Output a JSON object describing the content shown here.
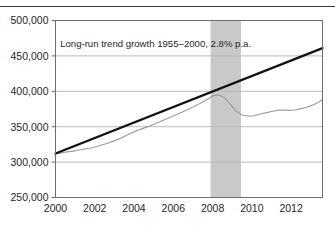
{
  "chart_data": {
    "type": "line",
    "title": "",
    "xlabel": "",
    "ylabel": "",
    "xlim": [
      2000,
      2013.6
    ],
    "ylim": [
      250000,
      500000
    ],
    "grid": true,
    "gridlines_y": [
      300000,
      350000,
      400000,
      450000
    ],
    "legend_position": "none",
    "xticks": [
      2000,
      2002,
      2004,
      2006,
      2008,
      2010,
      2012
    ],
    "xtick_labels": [
      "2000",
      "2002",
      "2004",
      "2006",
      "2008",
      "2012012"
    ],
    "xtick_labels_fixed": [
      "2000",
      "2002",
      "2004",
      "2006",
      "2008",
      "2010",
      "2012"
    ],
    "yticks": [
      250000,
      300000,
      350000,
      400000,
      450000,
      500000
    ],
    "ytick_labels": [
      "250,000",
      "300,000",
      "350,000",
      "400,000",
      "450,000",
      "500,000"
    ],
    "annotations": [
      {
        "text": "Long-run trend growth 1955–2000, 2.8% p.a.",
        "x": 2005.1,
        "y": 462000
      }
    ],
    "shaded_regions": [
      {
        "name": "recession-band",
        "x_start": 2007.9,
        "x_end": 2009.45,
        "color": "#c9c9c9"
      }
    ],
    "series": [
      {
        "name": "Long-run trend",
        "style": "trend-line",
        "color": "#111111",
        "width": 2.2,
        "x": [
          2000.0,
          2013.6
        ],
        "values": [
          312000,
          461000
        ]
      },
      {
        "name": "Actual",
        "style": "actual-line",
        "color": "#9a9a9a",
        "width": 1.1,
        "x": [
          2000.0,
          2000.3,
          2000.6,
          2000.9,
          2001.2,
          2001.5,
          2001.8,
          2002.1,
          2002.4,
          2002.7,
          2003.0,
          2003.3,
          2003.6,
          2003.9,
          2004.2,
          2004.5,
          2004.8,
          2005.1,
          2005.4,
          2005.7,
          2006.0,
          2006.3,
          2006.6,
          2006.9,
          2007.2,
          2007.5,
          2007.8,
          2008.0,
          2008.3,
          2008.6,
          2008.9,
          2009.2,
          2009.5,
          2009.8,
          2010.1,
          2010.4,
          2010.7,
          2011.0,
          2011.3,
          2011.6,
          2011.9,
          2012.2,
          2012.5,
          2012.8,
          2013.1,
          2013.4,
          2013.6
        ],
        "values": [
          311500,
          313000,
          314500,
          315500,
          317000,
          318500,
          320000,
          322000,
          324500,
          327000,
          330000,
          333500,
          337500,
          341500,
          345000,
          348000,
          351000,
          354500,
          358000,
          361500,
          365000,
          368500,
          372500,
          376500,
          380500,
          385000,
          389500,
          393500,
          395000,
          391000,
          382000,
          372000,
          366500,
          365000,
          365500,
          367500,
          369500,
          371500,
          373000,
          373500,
          373000,
          373500,
          375500,
          377500,
          380500,
          384500,
          388500
        ]
      }
    ]
  },
  "axis": {
    "y_tick_labels": [
      "500,000",
      "450,000",
      "400,000",
      "350,000",
      "300,000",
      "250,000"
    ],
    "x_tick_labels": [
      "2000",
      "2002",
      "2004",
      "2006",
      "2008",
      "2010",
      "2012"
    ]
  },
  "annotation": {
    "trend_label": "Long-run trend growth 1955–2000, 2.8% p.a."
  },
  "colors": {
    "trend_line": "#111111",
    "actual_line": "#9a9a9a",
    "recession_band": "#c9c9c9",
    "grid": "#b9b9b9",
    "frame": "#6e6e6e",
    "rule": "#3a3a3a"
  }
}
